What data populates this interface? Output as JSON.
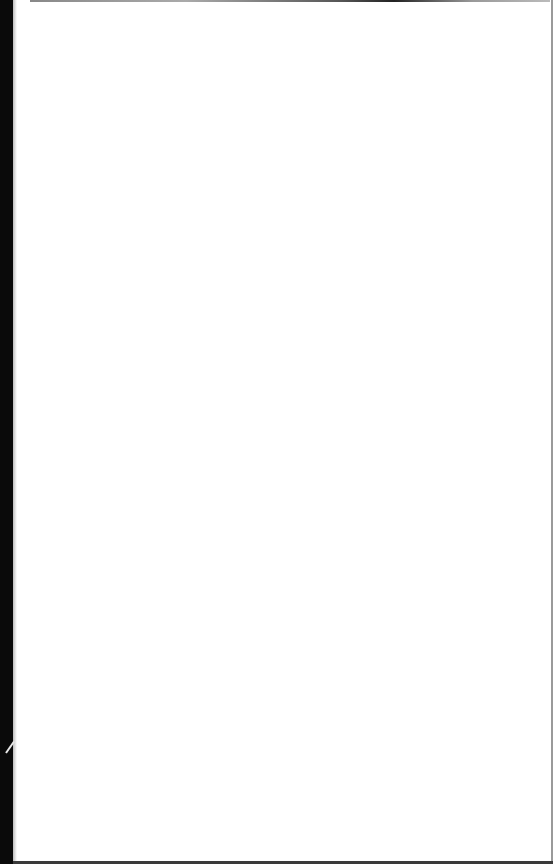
{
  "document": {
    "type": "scanned-page",
    "blank": true,
    "text": "",
    "colors": {
      "paper": "#ffffff",
      "binding_edge": "#0a0a0a",
      "border": "#9a9a9a"
    }
  }
}
